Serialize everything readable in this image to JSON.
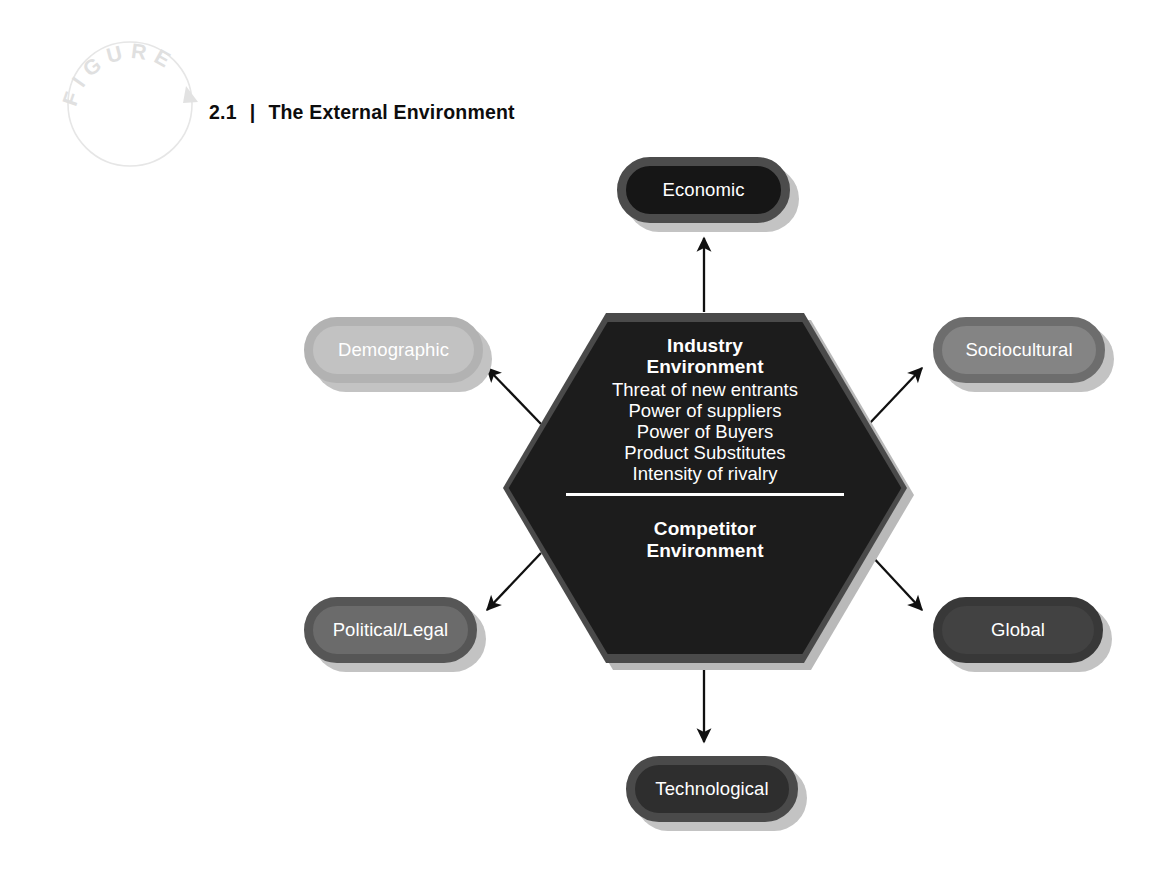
{
  "figure": {
    "badge_text": "FIGURE",
    "badge_letters": [
      "F",
      "I",
      "G",
      "U",
      "R",
      "E"
    ],
    "number": "2.1",
    "separator": "|",
    "title": "The External Environment"
  },
  "center": {
    "heading_line1": "Industry",
    "heading_line2": "Environment",
    "forces": [
      "Threat of new entrants",
      "Power of suppliers",
      "Power of Buyers",
      "Product Substitutes",
      "Intensity of rivalry"
    ],
    "heading2_line1": "Competitor",
    "heading2_line2": "Environment"
  },
  "segments": [
    {
      "id": "economic",
      "label": "Economic",
      "fill": "#161616",
      "border": "#4c4c4c",
      "text_color": "#ffffff",
      "position": "top"
    },
    {
      "id": "sociocultural",
      "label": "Sociocultural",
      "fill": "#848484",
      "border": "#6d6d6d",
      "text_color": "#ffffff",
      "position": "upper-right"
    },
    {
      "id": "global",
      "label": "Global",
      "fill": "#424242",
      "border": "#383838",
      "text_color": "#ffffff",
      "position": "lower-right"
    },
    {
      "id": "technological",
      "label": "Technological",
      "fill": "#2e2e2e",
      "border": "#4a4a4a",
      "text_color": "#ffffff",
      "position": "bottom"
    },
    {
      "id": "political",
      "label": "Political/Legal",
      "fill": "#6b6b6b",
      "border": "#565656",
      "text_color": "#ffffff",
      "position": "lower-left"
    },
    {
      "id": "demographic",
      "label": "Demographic",
      "fill": "#c2c2c2",
      "border": "#b2b2b2",
      "text_color": "#ffffff",
      "position": "upper-left"
    }
  ],
  "arrows": [
    {
      "id": "arrow-to-economic",
      "from": "center",
      "to": "economic",
      "direction": "up"
    },
    {
      "id": "arrow-to-demographic",
      "from": "center",
      "to": "demographic",
      "direction": "up-left"
    },
    {
      "id": "arrow-to-sociocultural",
      "from": "center",
      "to": "sociocultural",
      "direction": "up-right"
    },
    {
      "id": "arrow-to-political",
      "from": "center",
      "to": "political",
      "direction": "down-left"
    },
    {
      "id": "arrow-to-global",
      "from": "center",
      "to": "global",
      "direction": "down-right"
    },
    {
      "id": "arrow-to-technological",
      "from": "center",
      "to": "technological",
      "direction": "down"
    }
  ],
  "colors": {
    "background": "#ffffff",
    "hexagon_fill": "#1c1c1c",
    "hexagon_border": "#4a4a4a",
    "hexagon_text": "#ffffff",
    "arrow": "#101010",
    "badge_outline": "#e4e4e4",
    "title_text": "#0d0d0d"
  }
}
